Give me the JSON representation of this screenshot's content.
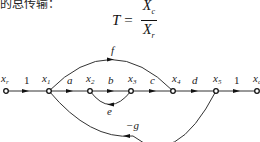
{
  "header_fragment": "的总传输：",
  "formula": {
    "lhs": "T",
    "eq": "=",
    "numerator": "X",
    "numerator_sub": "c",
    "denominator": "X",
    "denominator_sub": "r"
  },
  "diagram": {
    "type": "signal-flow-graph",
    "nodes": [
      {
        "id": "xr",
        "label": "x",
        "sub": "r"
      },
      {
        "id": "x1",
        "label": "x",
        "sub": "1"
      },
      {
        "id": "x2",
        "label": "x",
        "sub": "2"
      },
      {
        "id": "x3",
        "label": "x",
        "sub": "3"
      },
      {
        "id": "x4",
        "label": "x",
        "sub": "4"
      },
      {
        "id": "x5",
        "label": "x",
        "sub": "5"
      },
      {
        "id": "xc",
        "label": "x",
        "sub": "c"
      }
    ],
    "branches": [
      {
        "from": "xr",
        "to": "x1",
        "gain": "1"
      },
      {
        "from": "x1",
        "to": "x2",
        "gain": "a"
      },
      {
        "from": "x2",
        "to": "x3",
        "gain": "b"
      },
      {
        "from": "x3",
        "to": "x4",
        "gain": "c"
      },
      {
        "from": "x4",
        "to": "x5",
        "gain": "d"
      },
      {
        "from": "x5",
        "to": "xc",
        "gain": "1"
      },
      {
        "from": "x1",
        "to": "x4",
        "gain": "f"
      },
      {
        "from": "x3",
        "to": "x2",
        "gain": "e"
      },
      {
        "from": "x5",
        "to": "x1",
        "gain": "−g"
      }
    ]
  }
}
